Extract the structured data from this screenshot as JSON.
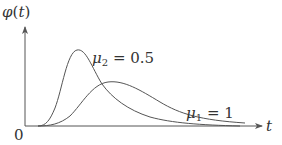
{
  "figure": {
    "y_axis_label": {
      "fn": "φ",
      "open": "(",
      "var": "t",
      "close": ")"
    },
    "x_axis_label": "t",
    "origin_label": "0",
    "curves": [
      {
        "name": "mu2",
        "symbol": "μ",
        "subscript": "2",
        "equals": " = 0.5",
        "label": "μ2 = 0.5"
      },
      {
        "name": "mu1",
        "symbol": "μ",
        "subscript": "1",
        "equals": " = 1",
        "label": "μ1 = 1"
      }
    ],
    "colors": {
      "line": "#555555",
      "text": "#333333",
      "background": "#ffffff"
    }
  }
}
